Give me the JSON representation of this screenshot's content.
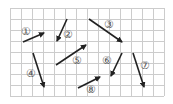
{
  "figure": {
    "type": "vector-grid-diagram",
    "grid": {
      "origin_px": [
        10,
        8
      ],
      "cell_px": 11,
      "columns": 14,
      "rows": 8,
      "line_color": "#cccccc"
    },
    "arrow_color": "#222222",
    "label_color": "#555555",
    "arrows": [
      {
        "id": "1",
        "label": "①",
        "from": [
          23,
          42
        ],
        "to": [
          44,
          33
        ],
        "label_pos": [
          21,
          35
        ]
      },
      {
        "id": "2",
        "label": "②",
        "from": [
          67,
          19
        ],
        "to": [
          57,
          41
        ],
        "label_pos": [
          63,
          38
        ]
      },
      {
        "id": "3",
        "label": "③",
        "from": [
          89,
          19
        ],
        "to": [
          122,
          42
        ],
        "label_pos": [
          104,
          28
        ]
      },
      {
        "id": "4",
        "label": "④",
        "from": [
          33,
          53
        ],
        "to": [
          44,
          87
        ],
        "label_pos": [
          26,
          77
        ]
      },
      {
        "id": "5",
        "label": "⑤",
        "from": [
          56,
          65
        ],
        "to": [
          86,
          45
        ],
        "label_pos": [
          72,
          64
        ]
      },
      {
        "id": "6",
        "label": "⑥",
        "from": [
          122,
          53
        ],
        "to": [
          111,
          76
        ],
        "label_pos": [
          102,
          64
        ]
      },
      {
        "id": "7",
        "label": "⑦",
        "from": [
          133,
          53
        ],
        "to": [
          144,
          87
        ],
        "label_pos": [
          140,
          69
        ]
      },
      {
        "id": "8",
        "label": "⑧",
        "from": [
          78,
          88
        ],
        "to": [
          100,
          77
        ],
        "label_pos": [
          86,
          93
        ]
      }
    ]
  }
}
